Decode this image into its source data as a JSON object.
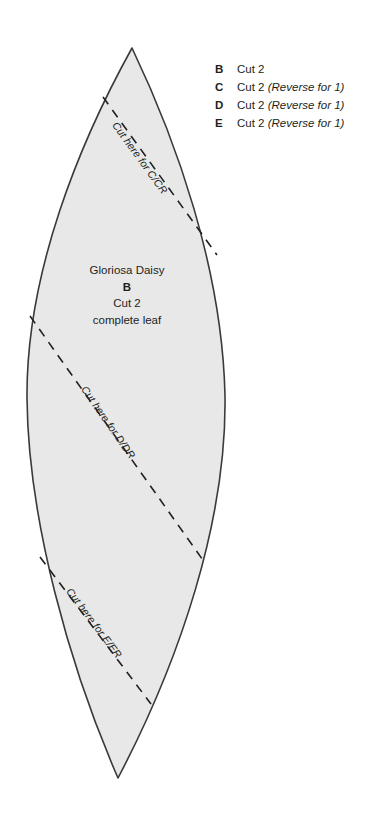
{
  "document": {
    "type": "sewing-pattern-template",
    "title": "Gloriosa Daisy leaf pattern piece",
    "background_color": "#ffffff"
  },
  "leaf": {
    "fill_color": "#e8e8e8",
    "stroke_color": "#3a3a3a",
    "center_label": {
      "name": "Gloriosa Daisy",
      "piece_letter": "B",
      "quantity": "Cut 2",
      "description": "complete leaf"
    },
    "cut_lines": [
      {
        "id": "c",
        "label": "Cut here for C/CR"
      },
      {
        "id": "d",
        "label": "Cut here for D/DR"
      },
      {
        "id": "e",
        "label": "Cut here for E/ER"
      }
    ]
  },
  "legend": {
    "rows": [
      {
        "key": "B",
        "quantity": "Cut 2",
        "note": ""
      },
      {
        "key": "C",
        "quantity": "Cut 2",
        "note": "(Reverse for 1)"
      },
      {
        "key": "D",
        "quantity": "Cut 2",
        "note": "(Reverse for 1)"
      },
      {
        "key": "E",
        "quantity": "Cut 2",
        "note": "(Reverse for 1)"
      }
    ]
  }
}
